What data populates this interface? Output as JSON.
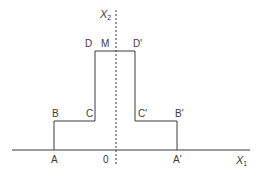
{
  "diagram": {
    "type": "symmetric step profile",
    "axes": {
      "x1": {
        "label": "X",
        "subscript": "1"
      },
      "x2": {
        "label": "X",
        "subscript": "2"
      },
      "origin": "0"
    },
    "points": {
      "A": "A",
      "B": "B",
      "C": "C",
      "D": "D",
      "M": "M",
      "D_prime": "D'",
      "C_prime": "C'",
      "B_prime": "B'",
      "A_prime": "A'"
    },
    "colors": {
      "line": "#3a3a3a",
      "background": "#ffffff"
    }
  }
}
